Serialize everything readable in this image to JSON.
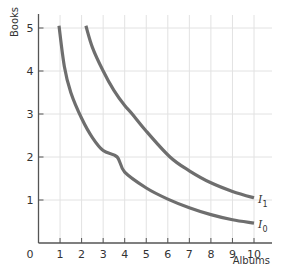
{
  "chart_data": {
    "type": "line",
    "title": "",
    "xlabel": "Albums",
    "ylabel": "Books",
    "xlim": [
      0,
      10.8
    ],
    "ylim": [
      0,
      5.3
    ],
    "origin_label": "0",
    "x_ticks": [
      1,
      2,
      3,
      4,
      5,
      6,
      7,
      8,
      9,
      10
    ],
    "y_ticks": [
      1,
      2,
      3,
      4,
      5
    ],
    "grid": true,
    "legend": "inline labels at right end of curves",
    "series": [
      {
        "name": "I0",
        "label_main": "I",
        "label_sub": "0",
        "x": [
          0.95,
          1.2,
          1.5,
          2.0,
          2.5,
          3.0,
          3.65,
          4.0,
          5.0,
          6.0,
          7.0,
          8.0,
          9.0,
          10.0
        ],
        "y": [
          5.05,
          4.1,
          3.5,
          2.9,
          2.45,
          2.15,
          2.0,
          1.65,
          1.28,
          1.02,
          0.82,
          0.66,
          0.54,
          0.46
        ]
      },
      {
        "name": "I1",
        "label_main": "I",
        "label_sub": "1",
        "x": [
          2.2,
          2.5,
          3.0,
          3.5,
          4.0,
          4.35,
          5.0,
          6.1,
          7.0,
          8.0,
          9.0,
          10.0
        ],
        "y": [
          5.05,
          4.55,
          4.0,
          3.55,
          3.2,
          3.0,
          2.6,
          2.0,
          1.68,
          1.4,
          1.2,
          1.05
        ]
      }
    ]
  },
  "style": {
    "curve_color": "#6e6e6e",
    "grid_color": "#e2e2e2",
    "axis_color": "#555555"
  }
}
